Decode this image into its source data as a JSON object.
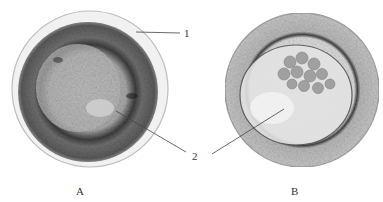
{
  "figure": {
    "panels": [
      {
        "id": "A",
        "label": "A",
        "description": "Cell with outer membrane, dark granular cortical ring and lighter central region"
      },
      {
        "id": "B",
        "label": "B",
        "description": "Cell with granular cortex and central cavity containing clustered granules"
      }
    ],
    "callouts": [
      {
        "number": "1",
        "target": "outer membrane of cell A"
      },
      {
        "number": "2",
        "target": "central region of cells A and B"
      }
    ],
    "colors": {
      "background": "#ffffff",
      "membrane": "#c8c8c8",
      "cortex_A": "#6b6b6b",
      "center_A": "#b8b8b8",
      "cortex_B": "#bdbdbd",
      "cavity_B": "#e4e4e4",
      "leader_line": "#444444"
    }
  }
}
